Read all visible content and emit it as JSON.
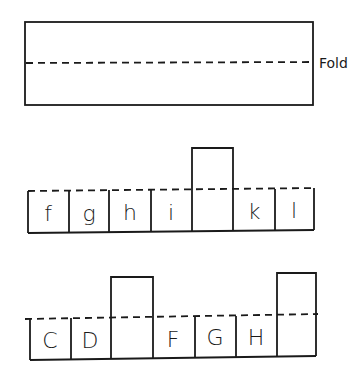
{
  "diagram": {
    "fold_strip": {
      "label": "Fold"
    },
    "row_lowercase": {
      "cells": [
        {
          "letter": "f",
          "raised": false
        },
        {
          "letter": "g",
          "raised": false
        },
        {
          "letter": "h",
          "raised": false
        },
        {
          "letter": "i",
          "raised": false
        },
        {
          "letter": "",
          "raised": true
        },
        {
          "letter": "k",
          "raised": false
        },
        {
          "letter": "l",
          "raised": false
        }
      ]
    },
    "row_uppercase": {
      "cells": [
        {
          "letter": "C",
          "raised": false
        },
        {
          "letter": "D",
          "raised": false
        },
        {
          "letter": "",
          "raised": true
        },
        {
          "letter": "F",
          "raised": false
        },
        {
          "letter": "G",
          "raised": false
        },
        {
          "letter": "H",
          "raised": false
        },
        {
          "letter": "",
          "raised": true
        }
      ]
    }
  }
}
